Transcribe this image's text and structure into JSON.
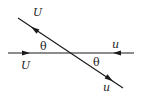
{
  "diagram": {
    "type": "velocity-vectors",
    "colors": {
      "line": "#1a1a1a",
      "background": "#ffffff"
    },
    "labels": {
      "upper_left": "U",
      "lower_left": "U",
      "upper_right": "u",
      "lower_right": "u",
      "angle_left": "θ",
      "angle_right": "θ"
    },
    "lines": {
      "horizontal": {
        "x1": 8,
        "y1": 53,
        "x2": 134,
        "y2": 53
      },
      "diagonal": {
        "x1": 18,
        "y1": 18,
        "x2": 123,
        "y2": 88
      }
    }
  }
}
